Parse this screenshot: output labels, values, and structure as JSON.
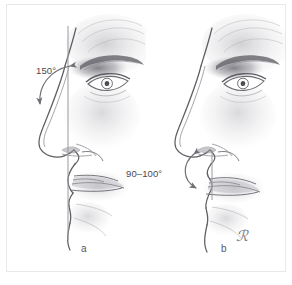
{
  "figure": {
    "background_color": "#ffffff",
    "border_color": "#e9e9ea",
    "ink_color": "#58585a",
    "shading_color": "#9a9aa0",
    "width": 292,
    "height": 285
  },
  "panels": [
    {
      "id": "a",
      "caption": "a",
      "subject": "profile-with-nasofrontal-angle",
      "reference_line": "vertical-facial-plane-line",
      "angle": {
        "label": "150°",
        "value": 150,
        "unit": "degrees",
        "name": "nasofrontal-angle",
        "marker": "curved-double-headed-arrow"
      }
    },
    {
      "id": "b",
      "caption": "b",
      "subject": "profile-with-nasolabial-angle",
      "reference_line": "columella-vertical-line",
      "angle": {
        "label": "90–100°",
        "value_min": 90,
        "value_max": 100,
        "unit": "degrees",
        "name": "nasolabial-angle",
        "marker": "curved-double-headed-arrow"
      }
    }
  ],
  "signature": {
    "text": "ℛ",
    "kind": "artist-monogram"
  }
}
